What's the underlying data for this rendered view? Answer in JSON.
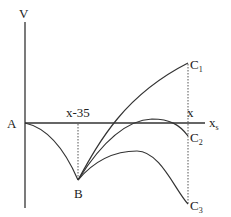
{
  "diagram": {
    "axis_labels": {
      "vertical": "V",
      "horizontal": "x",
      "horizontal_subscript": "s"
    },
    "points": {
      "origin": "A",
      "minimum": "B",
      "c1": {
        "main": "C",
        "sub": "1"
      },
      "c2": {
        "main": "C",
        "sub": "2"
      },
      "c3": {
        "main": "C",
        "sub": "3"
      }
    },
    "markers": {
      "left_position": "x-35",
      "right_position": "x"
    },
    "curves": [
      {
        "name": "A-to-B",
        "description": "decreasing concave curve from A down to B"
      },
      {
        "name": "B-to-C1",
        "description": "rising concave curve from B to C1 above axis"
      },
      {
        "name": "B-to-C2",
        "description": "rising then falling curve from B to C2, peaks just above axis"
      },
      {
        "name": "B-to-C3",
        "description": "rising then falling curve from B to C3, stays below axis"
      }
    ],
    "colors": {
      "line": "#333333",
      "background": "#ffffff"
    }
  }
}
